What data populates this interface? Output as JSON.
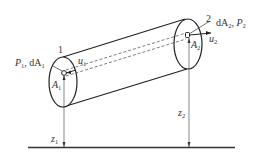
{
  "diagram": {
    "type": "stream-tube / pipe flow schematic",
    "section_1": {
      "number": "1",
      "pressure_area_label": "P",
      "pressure_area_sub": "1",
      "dA_label": "dA",
      "dA_sub": "1",
      "point_label": "A",
      "point_sub": "1",
      "velocity_label": "u",
      "velocity_sub": "1",
      "height_label": "z",
      "height_sub": "1"
    },
    "section_2": {
      "number": "2",
      "dA_label": "dA",
      "dA_sub": "2",
      "pressure_label": "P",
      "pressure_sub": "2",
      "point_label": "A",
      "point_sub": "2",
      "velocity_label": "u",
      "velocity_sub": "2",
      "height_label": "z",
      "height_sub": "2"
    },
    "separator": ", ",
    "colors": {
      "line": "#222222",
      "dashed": "#444444",
      "ground": "#333333"
    }
  }
}
